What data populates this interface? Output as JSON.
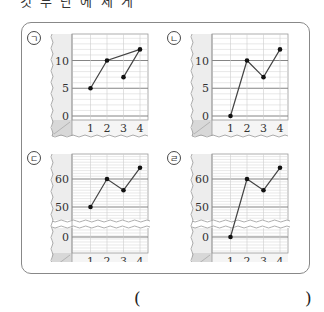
{
  "question": {
    "top_text": "것 두 단 에 세 게",
    "answer_open": "(",
    "answer_close": ")"
  },
  "chart_data": [
    {
      "label": "㉠",
      "type": "line",
      "x": [
        1,
        2,
        3,
        4
      ],
      "values": [
        5,
        10,
        7,
        12
      ],
      "connection_order": [
        1,
        2,
        4,
        3
      ],
      "yticks": [
        0,
        5,
        10
      ],
      "ylim": [
        0,
        13
      ],
      "broken_axis": false,
      "xlabel": "",
      "ylabel": "",
      "grid": true
    },
    {
      "label": "㉡",
      "type": "line",
      "x": [
        1,
        2,
        3,
        4
      ],
      "values": [
        0,
        10,
        7,
        12
      ],
      "connection_order": [
        1,
        2,
        3,
        4
      ],
      "yticks": [
        0,
        5,
        10
      ],
      "ylim": [
        0,
        13
      ],
      "broken_axis": false,
      "xlabel": "",
      "ylabel": "",
      "grid": true
    },
    {
      "label": "㉢",
      "type": "line",
      "x": [
        1,
        2,
        3,
        4
      ],
      "values": [
        50,
        60,
        56,
        64
      ],
      "connection_order": [
        1,
        2,
        3,
        4
      ],
      "yticks": [
        0,
        50,
        60
      ],
      "ylim": [
        0,
        66
      ],
      "broken_axis": true,
      "xlabel": "",
      "ylabel": "",
      "grid": true
    },
    {
      "label": "㉣",
      "type": "line",
      "x": [
        1,
        2,
        3,
        4
      ],
      "values": [
        0,
        60,
        56,
        64
      ],
      "connection_order": [
        1,
        2,
        3,
        4
      ],
      "yticks": [
        0,
        50,
        60
      ],
      "ylim": [
        0,
        66
      ],
      "broken_axis": true,
      "xlabel": "",
      "ylabel": "",
      "grid": true
    }
  ]
}
